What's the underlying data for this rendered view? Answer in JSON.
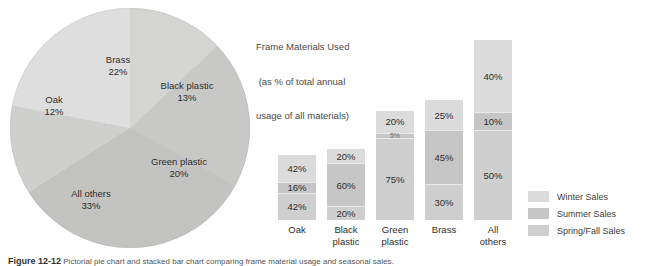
{
  "figure": {
    "caption_number": "Figure 12-12",
    "caption_text": "Pictorial pie chart and stacked bar chart comparing frame material usage and seasonal sales."
  },
  "pie": {
    "slices": [
      {
        "label": "Brass",
        "value_label": "22%",
        "value": 22,
        "color": "#dedede"
      },
      {
        "label": "Black plastic",
        "value_label": "13%",
        "value": 13,
        "color": "#d4d4d2"
      },
      {
        "label": "Green plastic",
        "value_label": "20%",
        "value": 20,
        "color": "#c8c8c6"
      },
      {
        "label": "All others",
        "value_label": "33%",
        "value": 33,
        "color": "#c3c3c1"
      },
      {
        "label": "Oak",
        "value_label": "12%",
        "value": 12,
        "color": "#cfcfcd"
      }
    ]
  },
  "bar": {
    "title_line1": "Frame Materials Used",
    "title_line2": " (as % of total annual",
    "title_line3": "usage of all materials)",
    "categories": [
      "Oak",
      "Black plastic",
      "Green plastic",
      "Brass",
      "All others"
    ],
    "category_lines": [
      [
        "Oak"
      ],
      [
        "Black",
        "plastic"
      ],
      [
        "Green",
        "plastic"
      ],
      [
        "Brass"
      ],
      [
        "All",
        "others"
      ]
    ],
    "columns": [
      {
        "category": "Oak",
        "total_label": "12%",
        "segments": [
          {
            "series": "Winter Sales",
            "label": "42%",
            "value": 42
          },
          {
            "series": "Summer Sales",
            "label": "16%",
            "value": 16
          },
          {
            "series": "Spring/Fall Sales",
            "label": "42%",
            "value": 42
          }
        ]
      },
      {
        "category": "Black plastic",
        "total_label": "13%",
        "segments": [
          {
            "series": "Winter Sales",
            "label": "20%",
            "value": 20
          },
          {
            "series": "Summer Sales",
            "label": "60%",
            "value": 60
          },
          {
            "series": "Spring/Fall Sales",
            "label": "20%",
            "value": 20
          }
        ]
      },
      {
        "category": "Green plastic",
        "total_label": "20%",
        "segments": [
          {
            "series": "Winter Sales",
            "label": "20%",
            "value": 20
          },
          {
            "series": "Summer Sales",
            "label": "5%",
            "value": 5
          },
          {
            "series": "Spring/Fall Sales",
            "label": "75%",
            "value": 75
          }
        ]
      },
      {
        "category": "Brass",
        "total_label": "22%",
        "segments": [
          {
            "series": "Winter Sales",
            "label": "25%",
            "value": 25
          },
          {
            "series": "Summer Sales",
            "label": "45%",
            "value": 45
          },
          {
            "series": "Spring/Fall Sales",
            "label": "30%",
            "value": 30
          }
        ]
      },
      {
        "category": "All others",
        "total_label": "33%",
        "segments": [
          {
            "series": "Winter Sales",
            "label": "40%",
            "value": 40
          },
          {
            "series": "Summer Sales",
            "label": "10%",
            "value": 10
          },
          {
            "series": "Spring/Fall Sales",
            "label": "50%",
            "value": 50
          }
        ]
      }
    ],
    "legend": [
      {
        "label": "Winter Sales",
        "color": "#dbdbdb"
      },
      {
        "label": "Summer Sales",
        "color": "#c6c6c6"
      },
      {
        "label": "Spring/Fall Sales",
        "color": "#cfcfcf"
      }
    ]
  },
  "chart_data": [
    {
      "type": "pie",
      "title": "",
      "categories": [
        "Brass",
        "Black plastic",
        "Green plastic",
        "All others",
        "Oak"
      ],
      "values": [
        22,
        13,
        20,
        33,
        12
      ],
      "unit": "%",
      "labels": [
        "Brass 22%",
        "Black plastic 13%",
        "Green plastic 20%",
        "All others 33%",
        "Oak 12%"
      ],
      "legend": "none (slices labelled in place)"
    },
    {
      "type": "bar",
      "subtype": "stacked-100-percent",
      "title": "Frame Materials Used (as % of total annual usage of all materials)",
      "xlabel": "",
      "ylabel": "",
      "unit": "%",
      "categories": [
        "Oak",
        "Black plastic",
        "Green plastic",
        "Brass",
        "All others"
      ],
      "category_totals_percent_of_all_materials": [
        12,
        13,
        20,
        22,
        33
      ],
      "series": [
        {
          "name": "Winter Sales",
          "values": [
            42,
            20,
            20,
            25,
            40
          ]
        },
        {
          "name": "Summer Sales",
          "values": [
            16,
            60,
            5,
            45,
            10
          ]
        },
        {
          "name": "Spring/Fall Sales",
          "values": [
            42,
            20,
            75,
            30,
            50
          ]
        }
      ],
      "stack_order_top_to_bottom": [
        "Winter Sales",
        "Summer Sales",
        "Spring/Fall Sales"
      ],
      "ylim": [
        0,
        100
      ],
      "grid": false,
      "legend_position": "right"
    }
  ]
}
